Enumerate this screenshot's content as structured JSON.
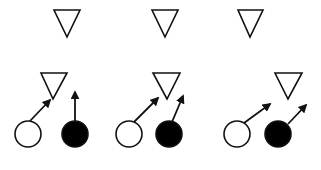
{
  "diagram": {
    "width": 321,
    "height": 170,
    "background": "#ffffff",
    "stroke_color": "#111111",
    "fill_dark": "#000000",
    "fill_light": "#ffffff",
    "panels": [
      {
        "id": "panel-1",
        "triangles": [
          {
            "name": "top-triangle",
            "top_left": [
              54,
              10
            ],
            "top_right": [
              80,
              10
            ],
            "tip": [
              67,
              37
            ]
          },
          {
            "name": "middle-triangle",
            "top_left": [
              41,
              73
            ],
            "top_right": [
              67,
              73
            ],
            "tip": [
              53,
              99
            ]
          }
        ],
        "circles": [
          {
            "name": "white-circle",
            "cx": 28,
            "cy": 134,
            "r": 13,
            "fill": "white"
          },
          {
            "name": "black-circle",
            "cx": 75,
            "cy": 134,
            "r": 13,
            "fill": "black"
          }
        ],
        "arrows": [
          {
            "name": "white-circle-arrow",
            "from": [
              30,
              121
            ],
            "to": [
              50,
              100
            ]
          },
          {
            "name": "black-circle-arrow",
            "from": [
              75,
              121
            ],
            "to": [
              75,
              92
            ]
          }
        ]
      },
      {
        "id": "panel-2",
        "triangles": [
          {
            "name": "top-triangle",
            "top_left": [
              152,
              10
            ],
            "top_right": [
              178,
              10
            ],
            "tip": [
              165,
              37
            ]
          },
          {
            "name": "middle-triangle",
            "top_left": [
              153,
              73
            ],
            "top_right": [
              180,
              73
            ],
            "tip": [
              167,
              99
            ]
          }
        ],
        "circles": [
          {
            "name": "white-circle",
            "cx": 129,
            "cy": 134,
            "r": 13,
            "fill": "white"
          },
          {
            "name": "black-circle",
            "cx": 169,
            "cy": 134,
            "r": 13,
            "fill": "black"
          }
        ],
        "arrows": [
          {
            "name": "white-circle-arrow",
            "from": [
              134,
              122
            ],
            "to": [
              158,
              98
            ]
          },
          {
            "name": "black-circle-arrow",
            "from": [
              172,
              122
            ],
            "to": [
              183,
              96
            ]
          }
        ]
      },
      {
        "id": "panel-3",
        "triangles": [
          {
            "name": "top-triangle",
            "top_left": [
              238,
              10
            ],
            "top_right": [
              263,
              10
            ],
            "tip": [
              250,
              37
            ]
          },
          {
            "name": "middle-triangle",
            "top_left": [
              275,
              73
            ],
            "top_right": [
              302,
              73
            ],
            "tip": [
              288,
              99
            ]
          }
        ],
        "circles": [
          {
            "name": "white-circle",
            "cx": 237,
            "cy": 134,
            "r": 13,
            "fill": "white"
          },
          {
            "name": "black-circle",
            "cx": 278,
            "cy": 134,
            "r": 13,
            "fill": "black"
          }
        ],
        "arrows": [
          {
            "name": "white-circle-arrow",
            "from": [
              244,
              123
            ],
            "to": [
              270,
              104
            ]
          },
          {
            "name": "black-circle-arrow",
            "from": [
              288,
              124
            ],
            "to": [
              306,
              105
            ]
          }
        ]
      }
    ]
  }
}
